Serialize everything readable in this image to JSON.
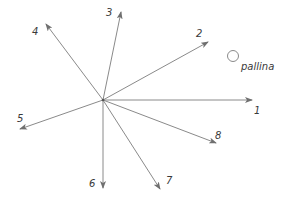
{
  "diagram": {
    "center": {
      "x": 103,
      "y": 100
    },
    "line_color": "#8a8a8a",
    "arrows": [
      {
        "id": "1",
        "label": "1",
        "x": 252,
        "y": 100,
        "lx": 254,
        "ly": 114
      },
      {
        "id": "2",
        "label": "2",
        "x": 208,
        "y": 42,
        "lx": 196,
        "ly": 37
      },
      {
        "id": "3",
        "label": "3",
        "x": 121,
        "y": 12,
        "lx": 106,
        "ly": 16
      },
      {
        "id": "4",
        "label": "4",
        "x": 46,
        "y": 24,
        "lx": 32,
        "ly": 35
      },
      {
        "id": "5",
        "label": "5",
        "x": 20,
        "y": 129,
        "lx": 17,
        "ly": 122
      },
      {
        "id": "6",
        "label": "6",
        "x": 103,
        "y": 188,
        "lx": 89,
        "ly": 187
      },
      {
        "id": "7",
        "label": "7",
        "x": 160,
        "y": 189,
        "lx": 166,
        "ly": 184
      },
      {
        "id": "8",
        "label": "8",
        "x": 216,
        "y": 143,
        "lx": 215,
        "ly": 139
      }
    ],
    "ball": {
      "label": "pallina",
      "cx": 233,
      "cy": 56,
      "r": 5.5,
      "lx": 241,
      "ly": 70
    }
  }
}
